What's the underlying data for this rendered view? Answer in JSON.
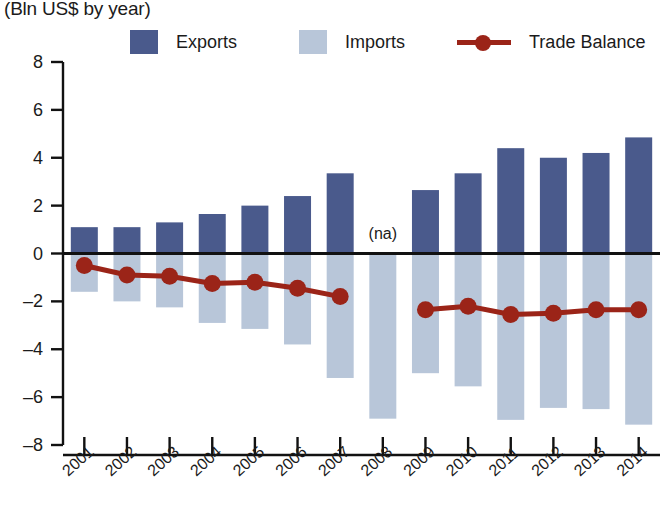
{
  "header": {
    "title_partial": "Exports and Imports, by year",
    "subtitle": "(Bln US$ by year)"
  },
  "legend": {
    "items": [
      {
        "label": "Exports",
        "color": "#4a5a8c",
        "marker": "square"
      },
      {
        "label": "Imports",
        "color": "#b8c6d9",
        "marker": "square"
      },
      {
        "label": "Trade Balance",
        "color": "#9b2418",
        "marker": "line-dot"
      }
    ]
  },
  "colors": {
    "exports": "#4a5a8c",
    "imports": "#b8c6d9",
    "trade_balance": "#9b2418",
    "axis": "#111111",
    "background": "#ffffff"
  },
  "annotations": [
    {
      "text": "(na)",
      "category": "2008",
      "note": "exports not available"
    }
  ],
  "chart_data": {
    "type": "bar",
    "title": "Exports and Imports, by year",
    "subtitle": "(Bln US$ by year)",
    "xlabel": "",
    "ylabel": "",
    "ylim": [
      -8,
      8
    ],
    "ytick_step": 2,
    "yticks": [
      8,
      6,
      4,
      2,
      0,
      -2,
      -4,
      -6,
      -8
    ],
    "grid": false,
    "legend_position": "top",
    "categories": [
      "2001",
      "2002",
      "2003",
      "2004",
      "2005",
      "2006",
      "2007",
      "2008",
      "2009",
      "2010",
      "2011",
      "2012",
      "2013",
      "2014"
    ],
    "series": [
      {
        "name": "Exports",
        "type": "bar",
        "color": "#4a5a8c",
        "values": [
          1.1,
          1.1,
          1.3,
          1.65,
          2.0,
          2.4,
          3.35,
          null,
          2.65,
          3.35,
          4.4,
          4.0,
          4.2,
          4.85
        ]
      },
      {
        "name": "Imports",
        "type": "bar",
        "color": "#b8c6d9",
        "values": [
          -1.6,
          -2.0,
          -2.25,
          -2.9,
          -3.15,
          -3.8,
          -5.2,
          -6.9,
          -5.0,
          -5.55,
          -6.95,
          -6.45,
          -6.5,
          -7.15
        ]
      },
      {
        "name": "Trade Balance",
        "type": "line",
        "color": "#9b2418",
        "values": [
          -0.5,
          -0.9,
          -0.95,
          -1.25,
          -1.2,
          -1.45,
          -1.8,
          null,
          -2.35,
          -2.2,
          -2.55,
          -2.5,
          -2.35,
          -2.35
        ]
      }
    ]
  }
}
